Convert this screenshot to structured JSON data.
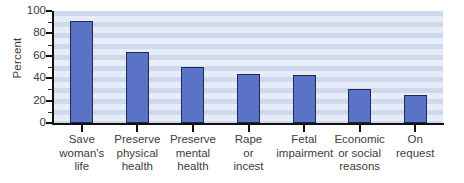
{
  "chart_data": {
    "type": "bar",
    "title": "",
    "xlabel": "",
    "ylabel": "Percent",
    "ylim": [
      0,
      100
    ],
    "ytick_labels": [
      "0",
      "20",
      "40",
      "60",
      "80",
      "100"
    ],
    "ytick_values": [
      0,
      20,
      40,
      60,
      80,
      100
    ],
    "yminor_values": [
      10,
      30,
      50,
      70,
      90
    ],
    "grid": false,
    "legend": "none",
    "bar_color": "#5a73c6",
    "bar_edge_color": "#1d2a52",
    "plot_background_stripe_colors": [
      "#cfd9ee",
      "#e6ecf8"
    ],
    "categories": [
      "Save woman's life",
      "Preserve physical health",
      "Preserve mental health",
      "Rape or incest",
      "Fetal impairment",
      "Economic or social reasons",
      "On request"
    ],
    "category_label_lines": [
      [
        "Save",
        "woman's",
        "life"
      ],
      [
        "Preserve",
        "physical",
        "health"
      ],
      [
        "Preserve",
        "mental",
        "health"
      ],
      [
        "Rape",
        "or",
        "incest"
      ],
      [
        "Fetal",
        "impairment"
      ],
      [
        "Economic",
        "or social",
        "reasons"
      ],
      [
        "On",
        "request"
      ]
    ],
    "values": [
      91,
      63,
      50,
      44,
      43,
      30,
      25
    ]
  }
}
